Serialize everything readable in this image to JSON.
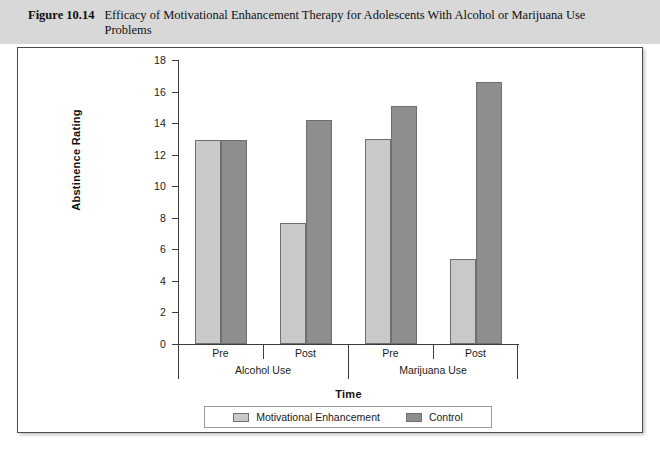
{
  "caption": {
    "figure_number": "Figure 10.14",
    "title": "Efficacy of Motivational Enhancement Therapy for Adolescents With Alcohol or Marijuana Use Problems"
  },
  "chart_data": {
    "type": "bar",
    "title": "Efficacy of Motivational Enhancement Therapy for Adolescents With Alcohol or Marijuana Use Problems",
    "xlabel": "Time",
    "ylabel": "Abstinence Rating",
    "ylim": [
      0,
      18
    ],
    "ytick_step": 2,
    "yticks": [
      18,
      16,
      14,
      12,
      10,
      8,
      6,
      4,
      2,
      0
    ],
    "grid": false,
    "legend_position": "bottom",
    "group_labels": [
      "Alcohol Use",
      "Marijuana Use"
    ],
    "categories": [
      "Pre",
      "Post",
      "Pre",
      "Post"
    ],
    "groups": [
      {
        "group": "Alcohol Use",
        "times": [
          {
            "time": "Pre",
            "Motivational Enhancement": 12.9,
            "Control": 12.9
          },
          {
            "time": "Post",
            "Motivational Enhancement": 7.7,
            "Control": 14.2
          }
        ]
      },
      {
        "group": "Marijuana Use",
        "times": [
          {
            "time": "Pre",
            "Motivational Enhancement": 13.0,
            "Control": 15.1
          },
          {
            "time": "Post",
            "Motivational Enhancement": 5.4,
            "Control": 16.6
          }
        ]
      }
    ],
    "series": [
      {
        "name": "Motivational Enhancement",
        "color": "#c9c9c9",
        "values": [
          12.9,
          7.7,
          13.0,
          5.4
        ]
      },
      {
        "name": "Control",
        "color": "#8e8e8e",
        "values": [
          12.9,
          14.2,
          15.1,
          16.6
        ]
      }
    ]
  },
  "legend": {
    "entries": [
      {
        "label": "Motivational Enhancement",
        "swatch": "light"
      },
      {
        "label": "Control",
        "swatch": "dark"
      }
    ]
  },
  "colors": {
    "caption_band": "#d8d8d8",
    "frame_border": "#4a4a4a",
    "plot_background": "#ffffff",
    "series_light": "#c9c9c9",
    "series_dark": "#8e8e8e",
    "axis": "#3b3b3b"
  }
}
